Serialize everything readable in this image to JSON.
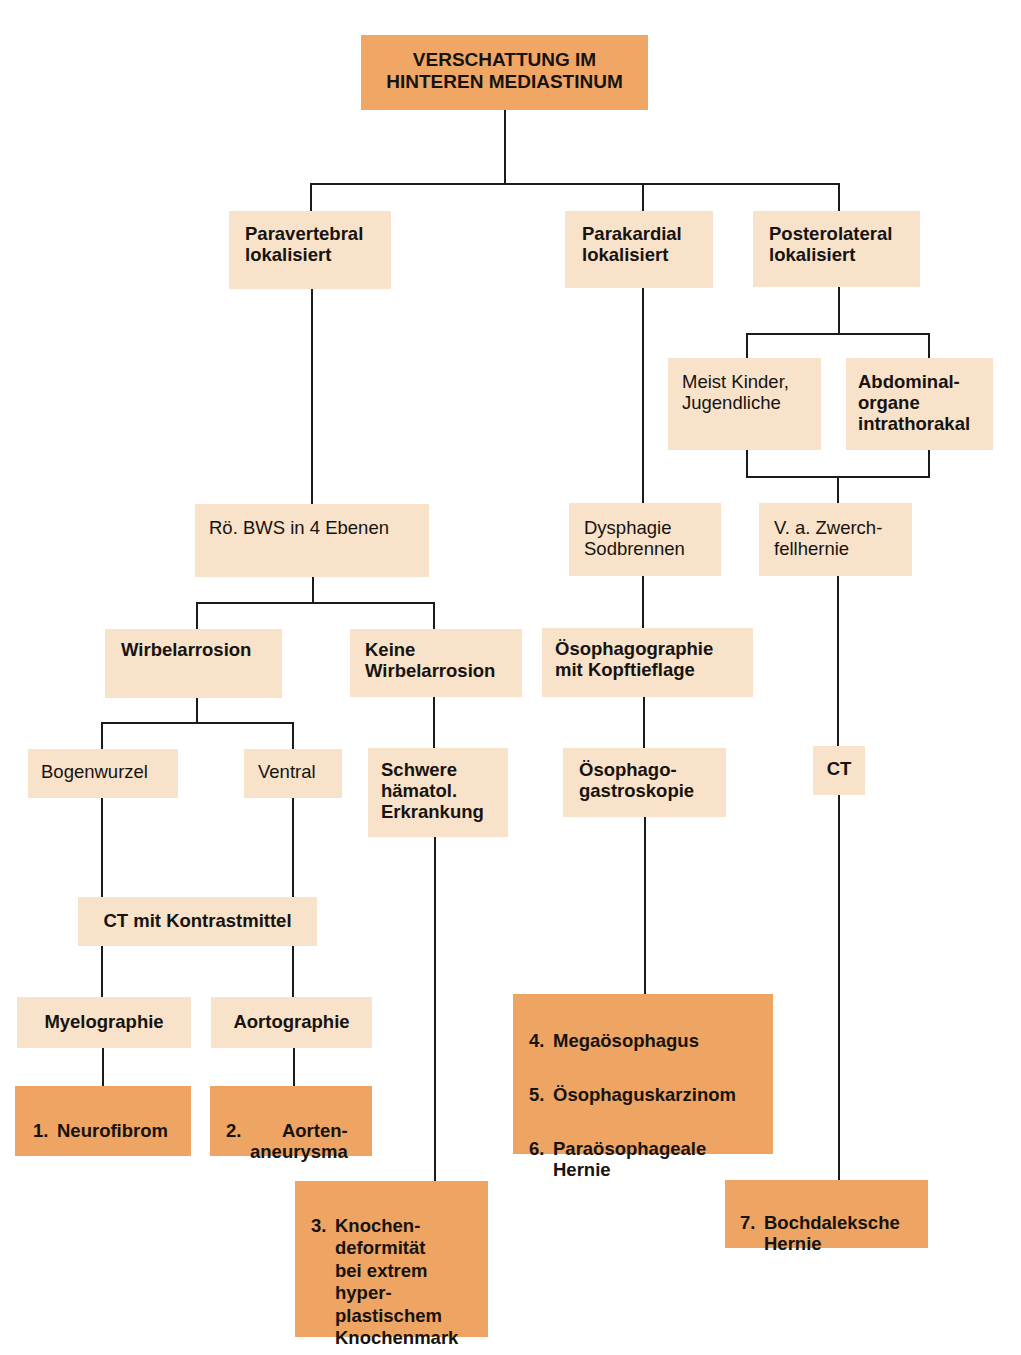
{
  "diagram": {
    "type": "flowchart",
    "root": {
      "label": "VERSCHATTUNG IM\nHINTEREN MEDIASTINUM"
    },
    "localization": {
      "paravertebral": "Paravertebral\nlokalisiert",
      "parakardial": "Parakardial\nlokalisiert",
      "posterolateral": "Posterolateral\nlokalisiert"
    },
    "posterolateral_branch": {
      "kinder": "Meist Kinder,\nJugendliche",
      "abdominal": "Abdominal-\norgane\nintrathorakal",
      "zwerchfell": "V. a. Zwerch-\nfellhernie",
      "ct": "CT"
    },
    "paravertebral_branch": {
      "roe_bws": "Rö. BWS in 4 Ebenen",
      "wirbelarrosion": "Wirbelarrosion",
      "keine_wirbelarrosion": "Keine\nWirbelarrosion",
      "bogenwurzel": "Bogenwurzel",
      "ventral": "Ventral",
      "schwere": "Schwere\nhämatol.\nErkrankung",
      "ct_km": "CT mit Kontrastmittel",
      "myelographie": "Myelographie",
      "aortographie": "Aortographie"
    },
    "parakardial_branch": {
      "dysphagie": "Dysphagie\nSodbrennen",
      "oesophagographie": "Ösophagographie\nmit Kopftieflage",
      "oesophagoskopie": "Ösophago-\ngastroskopie"
    },
    "diagnoses": [
      {
        "num": "1.",
        "label": "Neurofibrom"
      },
      {
        "num": "2.",
        "label": "Aorten-\naneurysma"
      },
      {
        "num": "3.",
        "label": "Knochen-\ndeformität\nbei extrem\nhyper-\nplastischem\nKnochenmark"
      },
      {
        "num": "4.",
        "label": "Megaösophagus"
      },
      {
        "num": "5.",
        "label": "Ösophaguskarzinom"
      },
      {
        "num": "6.",
        "label": "Paraösophageale\nHernie"
      },
      {
        "num": "7.",
        "label": "Bochdaleksche\nHernie"
      }
    ],
    "colors": {
      "step_box": "#F8E2C9",
      "diagnosis_box": "#EEA462",
      "root_box": "#F0A766",
      "connector": "#1b1b1b"
    }
  }
}
